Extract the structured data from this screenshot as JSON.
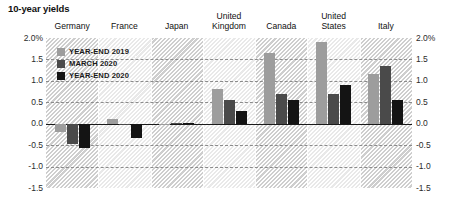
{
  "title": "10-year yields",
  "legend": {
    "items": [
      {
        "label": "YEAR-END 2019",
        "color": "#9d9d9d"
      },
      {
        "label": "MARCH 2020",
        "color": "#4a4a4a"
      },
      {
        "label": "YEAR-END 2020",
        "color": "#141414"
      }
    ]
  },
  "axis": {
    "top_left_label": "2.0%",
    "top_right_label": "2.0%",
    "ticks": [
      "1.5",
      "1.0",
      "0.5",
      "0.0",
      "-0.5",
      "-1.0",
      "-1.5"
    ],
    "tick_values": [
      1.5,
      1.0,
      0.5,
      0.0,
      -0.5,
      -1.0,
      -1.5
    ]
  },
  "chart_data": {
    "type": "bar",
    "title": "10-year yields",
    "xlabel": "",
    "ylabel": "",
    "ylim": [
      -1.5,
      2.0
    ],
    "unit": "%",
    "grid": true,
    "legend_position": "inside-top-left",
    "categories": [
      "Germany",
      "France",
      "Japan",
      "United\nKingdom",
      "Canada",
      "United\nStates",
      "Italy"
    ],
    "series": [
      {
        "name": "YEAR-END 2019",
        "color": "#9d9d9d",
        "values": [
          -0.19,
          0.12,
          -0.01,
          0.8,
          1.65,
          1.9,
          1.15
        ]
      },
      {
        "name": "MARCH 2020",
        "color": "#4a4a4a",
        "values": [
          -0.48,
          -0.03,
          0.01,
          0.55,
          0.7,
          0.7,
          1.35
        ]
      },
      {
        "name": "YEAR-END 2020",
        "color": "#141414",
        "values": [
          -0.57,
          -0.34,
          0.02,
          0.3,
          0.55,
          0.9,
          0.55
        ]
      }
    ]
  }
}
